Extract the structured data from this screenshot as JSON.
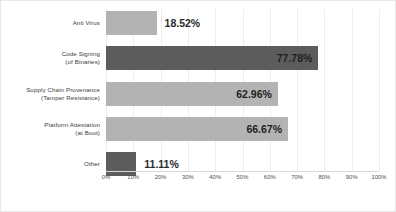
{
  "chart_data": {
    "type": "bar",
    "orientation": "horizontal",
    "title": "",
    "xlabel": "",
    "ylabel": "",
    "xlim": [
      0,
      100
    ],
    "grid": true,
    "legend": "none",
    "categories": [
      "Anti Virus",
      "Code Signing\n(of Binaries)",
      "Supply Chain Provenance\n(Tamper Resistance)",
      "Platform Attestation\n(at Boot)",
      "Other"
    ],
    "values": [
      18.52,
      77.78,
      62.96,
      66.67,
      11.11
    ],
    "value_labels": [
      "18.52%",
      "77.78%",
      "62.96%",
      "66.67%",
      "11.11%"
    ],
    "tick_labels": [
      "0%",
      "10%",
      "20%",
      "30%",
      "40%",
      "50%",
      "60%",
      "70%",
      "80%",
      "90%",
      "100%"
    ],
    "tick_values": [
      0,
      10,
      20,
      30,
      40,
      50,
      60,
      70,
      80,
      90,
      100
    ],
    "bars": [
      {
        "line1": "Anti Virus",
        "line2": "",
        "value": 18.52,
        "label": "18.52%",
        "color": "#b3b3b3",
        "tone": "light",
        "label_position": "outside"
      },
      {
        "line1": "Code Signing",
        "line2": "(of Binaries)",
        "value": 77.78,
        "label": "77.78%",
        "color": "#5c5c5c",
        "tone": "dark",
        "label_position": "inside"
      },
      {
        "line1": "Supply Chain Provenance",
        "line2": "(Tamper Resistance)",
        "value": 62.96,
        "label": "62.96%",
        "color": "#b3b3b3",
        "tone": "light",
        "label_position": "inside"
      },
      {
        "line1": "Platform Attestation",
        "line2": "(at Boot)",
        "value": 66.67,
        "label": "66.67%",
        "color": "#b3b3b3",
        "tone": "light",
        "label_position": "inside"
      },
      {
        "line1": "Other",
        "line2": "",
        "value": 11.11,
        "label": "11.11%",
        "color": "#5c5c5c",
        "tone": "dark",
        "label_position": "outside"
      }
    ],
    "colors": {
      "light_bar": "#b3b3b3",
      "dark_bar": "#5c5c5c",
      "gridline": "#ededed",
      "axis": "#d9d9d9",
      "label_text": "#3d3d3d",
      "value_text": "#2b2b2b",
      "background": "#ffffff"
    }
  }
}
